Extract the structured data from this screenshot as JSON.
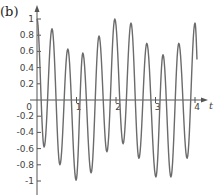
{
  "panel_label": "(b)",
  "chart_data": {
    "type": "line",
    "title": "",
    "xlabel": "t",
    "ylabel": "",
    "xlim": [
      0,
      4.1
    ],
    "ylim": [
      -1.1,
      1.15
    ],
    "grid": false,
    "legend": null,
    "x_ticks": [
      1,
      2,
      3,
      4
    ],
    "x_tick_labels": [
      "1",
      "2",
      "3",
      "4"
    ],
    "origin_label": "0",
    "y_ticks": [
      1,
      0.8,
      0.6,
      0.4,
      0.2,
      -0.2,
      -0.4,
      -0.6,
      -0.8,
      -1
    ],
    "y_tick_labels": [
      "1",
      "0.8",
      "0.6",
      "0.4",
      "0.2",
      "-0.2",
      "-0.4",
      "-0.6",
      "-0.8",
      "-1"
    ],
    "series": [
      {
        "name": "signal",
        "color": "#6b6b6b",
        "extrema": [
          {
            "t": 0.0,
            "y": 1.0
          },
          {
            "t": 0.18,
            "y": -0.58
          },
          {
            "t": 0.38,
            "y": 0.88
          },
          {
            "t": 0.58,
            "y": -0.8
          },
          {
            "t": 0.78,
            "y": 0.63
          },
          {
            "t": 0.99,
            "y": -0.99
          },
          {
            "t": 1.16,
            "y": 0.58
          },
          {
            "t": 1.37,
            "y": -0.9
          },
          {
            "t": 1.57,
            "y": 0.79
          },
          {
            "t": 1.77,
            "y": -0.64
          },
          {
            "t": 1.97,
            "y": 1.0
          },
          {
            "t": 2.18,
            "y": -0.54
          },
          {
            "t": 2.38,
            "y": 0.95
          },
          {
            "t": 2.58,
            "y": -0.72
          },
          {
            "t": 2.78,
            "y": 0.7
          },
          {
            "t": 3.01,
            "y": -0.95
          },
          {
            "t": 3.19,
            "y": 0.56
          },
          {
            "t": 3.39,
            "y": -0.95
          },
          {
            "t": 3.59,
            "y": 0.7
          },
          {
            "t": 3.8,
            "y": -0.72
          },
          {
            "t": 4.0,
            "y": 0.95
          },
          {
            "t": 4.05,
            "y": 0.5
          }
        ]
      }
    ]
  },
  "layout": {
    "origin_px": [
      37,
      100
    ],
    "px_per_t": 39.5,
    "px_per_y": 81,
    "x_axis_end_px": 208,
    "y_axis_top_px": 5,
    "y_axis_bottom_px": 195
  }
}
